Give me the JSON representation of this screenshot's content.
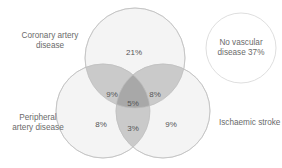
{
  "diagram": {
    "type": "venn",
    "sets": [
      {
        "id": "cad",
        "label_line1": "Coronary artery",
        "label_line2": "disease"
      },
      {
        "id": "pad",
        "label_line1": "Peripheral",
        "label_line2": "artery disease"
      },
      {
        "id": "stroke",
        "label_line1": "Ischaemic stroke"
      },
      {
        "id": "none",
        "label_line1": "No vascular",
        "label_line2": "disease 37%"
      }
    ],
    "regions": {
      "cad_only": "21%",
      "pad_only": "8%",
      "stroke_only": "9%",
      "cad_pad": "9%",
      "cad_stroke": "8%",
      "pad_stroke": "3%",
      "all_three": "5%",
      "none": "37%"
    },
    "colors": {
      "circle_fill": "#f3f3f3",
      "circle_stroke": "#c8c8c8",
      "pair_overlap": "#c9c9c9",
      "triple_overlap": "#a9a9a9",
      "text": "#6a6a6a"
    }
  }
}
